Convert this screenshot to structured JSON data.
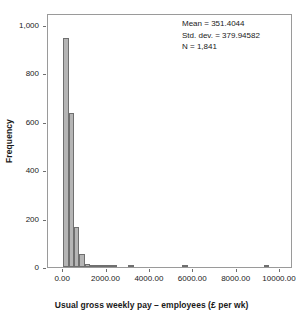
{
  "chart_data": {
    "type": "bar",
    "subtype": "histogram",
    "title": "",
    "xlabel": "Usual gross weekly pay – employees (£ per wk)",
    "ylabel": "Frequency",
    "xlim": [
      -700,
      10600
    ],
    "ylim": [
      0,
      1050
    ],
    "grid": false,
    "legend": false,
    "bin_width": 250,
    "bar_fill_color": "#b5b5b5",
    "bar_edge_color": "#6f6f6f",
    "frame_color": "#9a9a9a",
    "x_ticks": [
      {
        "value": 0,
        "label": "0.00"
      },
      {
        "value": 2000,
        "label": "2000.00"
      },
      {
        "value": 4000,
        "label": "4000.00"
      },
      {
        "value": 6000,
        "label": "6000.00"
      },
      {
        "value": 8000,
        "label": "8000.00"
      },
      {
        "value": 10000,
        "label": "10000.00"
      }
    ],
    "y_ticks": [
      {
        "value": 0,
        "label": "0"
      },
      {
        "value": 200,
        "label": "200"
      },
      {
        "value": 400,
        "label": "400"
      },
      {
        "value": 600,
        "label": "600"
      },
      {
        "value": 800,
        "label": "800"
      },
      {
        "value": 1000,
        "label": "1,000"
      }
    ],
    "bins": [
      {
        "x_center": 125,
        "x_left": 0,
        "x_right": 250,
        "frequency": 948
      },
      {
        "x_center": 375,
        "x_left": 250,
        "x_right": 500,
        "frequency": 635
      },
      {
        "x_center": 625,
        "x_left": 500,
        "x_right": 750,
        "frequency": 165
      },
      {
        "x_center": 875,
        "x_left": 750,
        "x_right": 1000,
        "frequency": 55
      },
      {
        "x_center": 1125,
        "x_left": 1000,
        "x_right": 1250,
        "frequency": 13
      },
      {
        "x_center": 1375,
        "x_left": 1250,
        "x_right": 1500,
        "frequency": 8
      },
      {
        "x_center": 1625,
        "x_left": 1500,
        "x_right": 1750,
        "frequency": 5
      },
      {
        "x_center": 1875,
        "x_left": 1750,
        "x_right": 2000,
        "frequency": 3
      },
      {
        "x_center": 2125,
        "x_left": 2000,
        "x_right": 2250,
        "frequency": 2
      },
      {
        "x_center": 2375,
        "x_left": 2250,
        "x_right": 2500,
        "frequency": 1
      },
      {
        "x_center": 3125,
        "x_left": 3000,
        "x_right": 3250,
        "frequency": 3
      },
      {
        "x_center": 5625,
        "x_left": 5500,
        "x_right": 5750,
        "frequency": 3
      },
      {
        "x_center": 9375,
        "x_left": 9250,
        "x_right": 9500,
        "frequency": 3
      }
    ],
    "categories": [
      125,
      375,
      625,
      875,
      1125,
      1375,
      1625,
      1875,
      2125,
      2375,
      3125,
      5625,
      9375
    ],
    "values": [
      948,
      635,
      165,
      55,
      13,
      8,
      5,
      3,
      2,
      1,
      3,
      3,
      3
    ],
    "annotations": {
      "mean_label": "Mean = 351.4044",
      "std_dev_label": "Std. dev. = 379.94582",
      "n_label": "N = 1,841",
      "mean": 351.4044,
      "std_dev": 379.94582,
      "n": 1841
    }
  }
}
